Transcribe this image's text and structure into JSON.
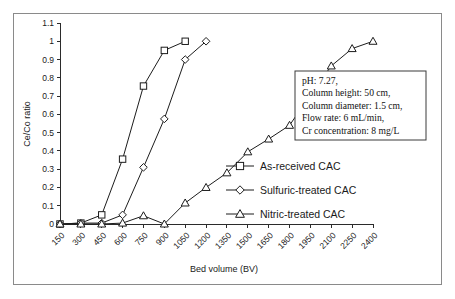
{
  "figure": {
    "background_color": "#ffffff",
    "border_color": "#8a8a8a",
    "axis_color": "#2b2b2b",
    "series_color": "#1c1c1c"
  },
  "annotation": {
    "name": "experimental-conditions-box",
    "lines": [
      "pH: 7.27,",
      "Column height: 50 cm,",
      "Column diameter: 1.5 cm,",
      "Flow rate: 6 mL/min,",
      "Cr concentration: 8 mg/L"
    ]
  },
  "chart_data": {
    "type": "line",
    "title": "",
    "xlabel": "Bed volume (BV)",
    "ylabel": "Ce/Co ratio",
    "xlim": [
      150,
      2400
    ],
    "ylim": [
      0,
      1.1
    ],
    "grid": false,
    "legend_position": "inside-right",
    "xticks": [
      150,
      300,
      450,
      600,
      750,
      900,
      1050,
      1200,
      1350,
      1500,
      1650,
      1800,
      1950,
      2100,
      2250,
      2400
    ],
    "xtick_labels": [
      "150",
      "300",
      "450",
      "600",
      "750",
      "900",
      "1050",
      "1200",
      "1350",
      "1500",
      "1650",
      "1800",
      "1950",
      "2100",
      "2250",
      "2400"
    ],
    "yticks": [
      0,
      0.1,
      0.2,
      0.3,
      0.4,
      0.5,
      0.6,
      0.7,
      0.8,
      0.9,
      1,
      1.1
    ],
    "ytick_labels": [
      "0",
      "0.1",
      "0.2",
      "0.3",
      "0.4",
      "0.5",
      "0.6",
      "0.7",
      "0.8",
      "0.9",
      "1",
      "1.1"
    ],
    "series": [
      {
        "name": "As-received CAC",
        "marker": "square",
        "x": [
          150,
          300,
          450,
          600,
          750,
          900,
          1050
        ],
        "values": [
          0,
          0.005,
          0.05,
          0.355,
          0.755,
          0.95,
          1.0
        ]
      },
      {
        "name": "Sulfuric-treated CAC",
        "marker": "diamond",
        "x": [
          150,
          300,
          450,
          600,
          750,
          900,
          1050,
          1200
        ],
        "values": [
          0,
          0.005,
          0.005,
          0.05,
          0.31,
          0.575,
          0.9,
          1.0
        ]
      },
      {
        "name": "Nitric-treated CAC",
        "marker": "triangle",
        "x": [
          150,
          300,
          450,
          600,
          750,
          900,
          1050,
          1200,
          1350,
          1500,
          1650,
          1800,
          1950,
          2100,
          2250,
          2400
        ],
        "values": [
          0,
          0.0,
          0.0,
          0.005,
          0.045,
          0.0,
          0.115,
          0.2,
          0.28,
          0.395,
          0.465,
          0.54,
          0.705,
          0.865,
          0.96,
          1.0
        ]
      }
    ]
  },
  "legend": {
    "items": [
      {
        "label": "As-received CAC",
        "marker": "square"
      },
      {
        "label": "Sulfuric-treated CAC",
        "marker": "diamond"
      },
      {
        "label": "Nitric-treated CAC",
        "marker": "triangle"
      }
    ]
  }
}
